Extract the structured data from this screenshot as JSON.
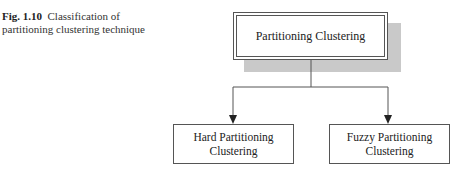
{
  "caption": {
    "label": "Fig. 1.10",
    "text": "Classification of partitioning clustering technique"
  },
  "diagram": {
    "root": "Partitioning Clustering",
    "children": [
      {
        "line1": "Hard Partitioning",
        "line2": "Clustering"
      },
      {
        "line1": "Fuzzy Partitioning",
        "line2": "Clustering"
      }
    ]
  }
}
